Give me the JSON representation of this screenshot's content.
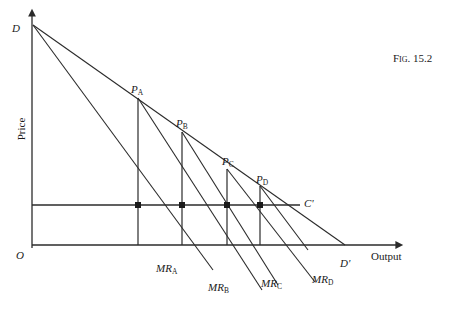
{
  "figure": {
    "caption_prefix": "Fig.",
    "caption_number": "15.2",
    "caption_full": "Fig. 15.2"
  },
  "axes": {
    "y_label": "Price",
    "x_label": "Output",
    "origin_label": "O",
    "y_axis_top_x": 32,
    "x_axis_y": 245,
    "x_axis_end": 400,
    "y_axis_top": 12
  },
  "curves": {
    "demand_start_label": "D",
    "demand_end_label": "D'",
    "cost_line_label": "C'",
    "cost_line_y": 205
  },
  "price_points": [
    {
      "label": "P",
      "sub": "A",
      "x": 138,
      "y": 98,
      "label_x": 131,
      "label_y": 84
    },
    {
      "label": "P",
      "sub": "B",
      "x": 182,
      "y": 132,
      "label_x": 176,
      "label_y": 118
    },
    {
      "label": "P",
      "sub": "C",
      "x": 227,
      "y": 169,
      "label_x": 222,
      "label_y": 156
    },
    {
      "label": "P",
      "sub": "D",
      "x": 260,
      "y": 186,
      "label_x": 256,
      "label_y": 174
    }
  ],
  "marginal_revenue": [
    {
      "label": "MR",
      "sub": "A",
      "label_x": 156,
      "label_y": 263
    },
    {
      "label": "MR",
      "sub": "B",
      "label_x": 208,
      "label_y": 282
    },
    {
      "label": "MR",
      "sub": "C",
      "label_x": 261,
      "label_y": 278
    },
    {
      "label": "MR",
      "sub": "D",
      "label_x": 312,
      "label_y": 274
    }
  ],
  "colors": {
    "ink": "#1a1a1a",
    "line": "#2b2b2b",
    "background": "#ffffff"
  }
}
